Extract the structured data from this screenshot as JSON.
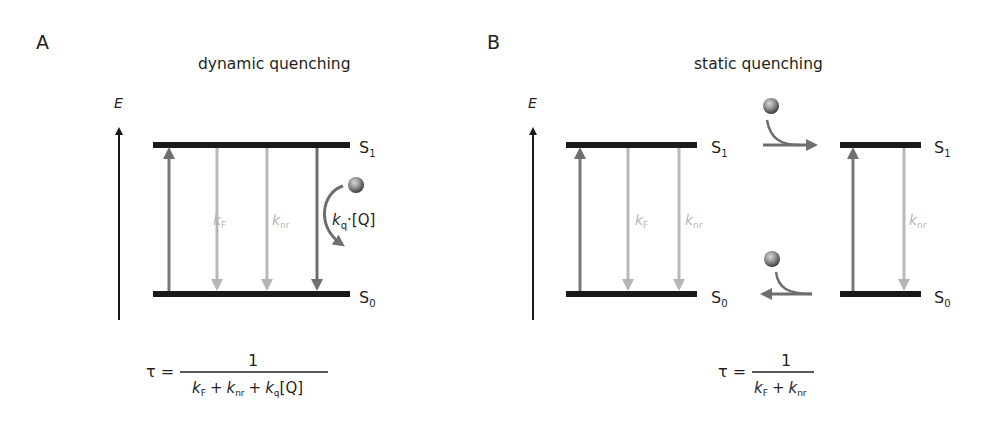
{
  "panels": [
    {
      "id": "A",
      "label": "A",
      "title": "dynamic quenching",
      "axis_label": "E",
      "levels": {
        "upper": "S",
        "upper_sub": "1",
        "lower": "S",
        "lower_sub": "0"
      },
      "rates": [
        {
          "k": "k",
          "sub": "F"
        },
        {
          "k": "k",
          "sub": "nr"
        },
        {
          "k": "k",
          "sub": "q",
          "suffix": "·[Q]"
        }
      ],
      "equation": {
        "lhs": "τ =",
        "numerator": "1",
        "denominator": [
          {
            "k": "k",
            "sub": "F"
          },
          {
            "op": "+"
          },
          {
            "k": "k",
            "sub": "nr"
          },
          {
            "op": "+"
          },
          {
            "k": "k",
            "sub": "q",
            "suffix": "[Q]"
          }
        ]
      }
    },
    {
      "id": "B",
      "label": "B",
      "title": "static quenching",
      "axis_label": "E",
      "levels": {
        "upper": "S",
        "upper_sub": "1",
        "lower": "S",
        "lower_sub": "0"
      },
      "rates_left": [
        {
          "k": "k",
          "sub": "F"
        },
        {
          "k": "k",
          "sub": "nr"
        }
      ],
      "rates_right": [
        {
          "k": "k",
          "sub": "nr"
        }
      ],
      "equation": {
        "lhs": "τ =",
        "numerator": "1",
        "denominator": [
          {
            "k": "k",
            "sub": "F"
          },
          {
            "op": "+"
          },
          {
            "k": "k",
            "sub": "nr"
          }
        ]
      }
    }
  ],
  "colors": {
    "level": "#1a1a1a",
    "excitation": "#7a7a7a",
    "radiative": "#b8b8b8",
    "quench": "#6e6e6e",
    "quencher": "#8a8a8a",
    "text": "#231f20",
    "faint_text": "#b0b0b0"
  }
}
